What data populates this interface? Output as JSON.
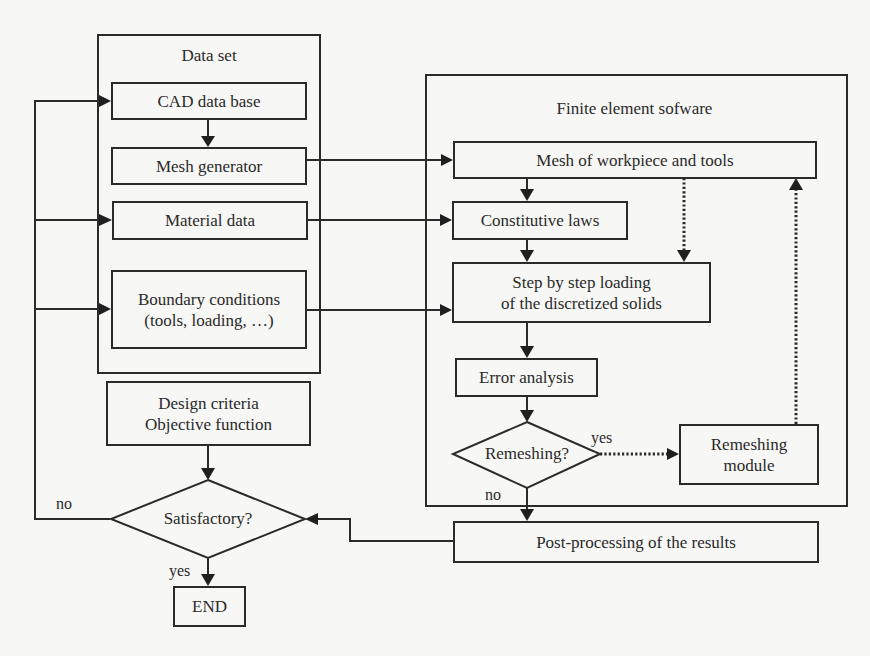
{
  "diagram": {
    "type": "flowchart",
    "groups": {
      "data_set": {
        "title": "Data set"
      },
      "fe_software": {
        "title": "Finite element sofware"
      }
    },
    "nodes": {
      "cad": "CAD data base",
      "mesh_gen": "Mesh generator",
      "material": "Material data",
      "boundary_line1": "Boundary conditions",
      "boundary_line2": "(tools, loading, …)",
      "design_line1": "Design criteria",
      "design_line2": "Objective function",
      "satisfactory": "Satisfactory?",
      "end": "END",
      "mesh_wp": "Mesh of workpiece and tools",
      "constitutive": "Constitutive laws",
      "step_line1": "Step by step loading",
      "step_line2": "of the discretized solids",
      "error": "Error analysis",
      "remeshing_q": "Remeshing?",
      "remesh_mod_line1": "Remeshing",
      "remesh_mod_line2": "module",
      "post": "Post-processing of the results"
    },
    "edge_labels": {
      "sat_no": "no",
      "sat_yes": "yes",
      "rem_yes": "yes",
      "rem_no": "no"
    },
    "edges": [
      {
        "from": "CAD data base",
        "to": "Mesh generator",
        "style": "solid"
      },
      {
        "from": "Mesh generator",
        "to": "Mesh of workpiece and tools",
        "style": "solid"
      },
      {
        "from": "Material data",
        "to": "Constitutive laws",
        "style": "solid"
      },
      {
        "from": "Boundary conditions",
        "to": "Step by step loading",
        "style": "solid"
      },
      {
        "from": "Mesh of workpiece and tools",
        "to": "Constitutive laws",
        "style": "solid"
      },
      {
        "from": "Mesh of workpiece and tools",
        "to": "Step by step loading",
        "style": "dotted"
      },
      {
        "from": "Constitutive laws",
        "to": "Step by step loading",
        "style": "solid"
      },
      {
        "from": "Step by step loading",
        "to": "Error analysis",
        "style": "solid"
      },
      {
        "from": "Error analysis",
        "to": "Remeshing?",
        "style": "solid"
      },
      {
        "from": "Remeshing?",
        "to": "Remeshing module",
        "label": "yes",
        "style": "dotted"
      },
      {
        "from": "Remeshing module",
        "to": "Mesh of workpiece and tools",
        "style": "dotted"
      },
      {
        "from": "Remeshing?",
        "to": "Post-processing of the results",
        "label": "no",
        "style": "solid"
      },
      {
        "from": "Post-processing of the results",
        "to": "Satisfactory?",
        "style": "solid"
      },
      {
        "from": "Design criteria",
        "to": "Satisfactory?",
        "style": "solid"
      },
      {
        "from": "Satisfactory?",
        "to": "END",
        "label": "yes",
        "style": "solid"
      },
      {
        "from": "Satisfactory?",
        "to": "CAD data base / Material data / Boundary conditions",
        "label": "no",
        "style": "solid"
      }
    ]
  },
  "colors": {
    "background": "#f7f7f5",
    "stroke": "#2b2b2b",
    "text": "#2a2a2a"
  }
}
